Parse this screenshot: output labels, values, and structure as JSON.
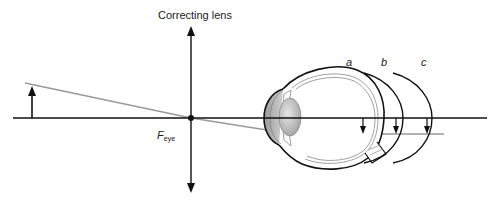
{
  "figure": {
    "lens_label": "Correcting lens",
    "focal_point_label": {
      "main": "F",
      "subscript": "eye"
    },
    "image_plane_labels": [
      "a",
      "b",
      "c"
    ],
    "colors": {
      "lines": "#111111",
      "ray": "#9a9a9a",
      "eye_outline": "#111111",
      "eye_inner": "#8a8a8a",
      "lens_fill": "#bdbdbd"
    },
    "elements": {
      "optical_axis": "horizontal optical axis",
      "correcting_lens": "thin lens (double arrow)",
      "object_arrow": "upright object arrow",
      "ray": "gray ray through focal point",
      "eye": "cross-section of eye",
      "image_arrows": [
        "image at a",
        "image at b",
        "image at c"
      ]
    }
  }
}
